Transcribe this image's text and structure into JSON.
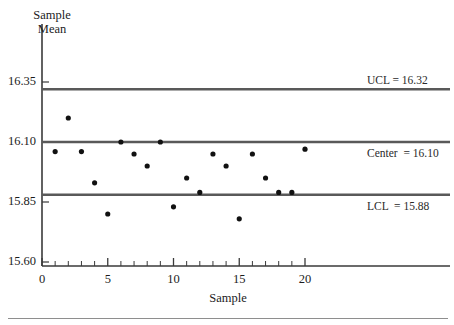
{
  "chart_data": {
    "type": "scatter",
    "title": "",
    "subtitle": "",
    "xlabel": "Sample",
    "ylabel": "Sample\nMean",
    "ylabel_line1": "Sample",
    "ylabel_line2": "Mean",
    "x": [
      1,
      2,
      3,
      4,
      5,
      6,
      7,
      8,
      9,
      10,
      11,
      12,
      13,
      14,
      15,
      16,
      17,
      18,
      19,
      20
    ],
    "values": [
      16.06,
      16.2,
      16.06,
      15.93,
      15.8,
      16.1,
      16.05,
      16.0,
      16.1,
      15.83,
      15.95,
      15.89,
      16.05,
      16.0,
      15.78,
      16.05,
      15.95,
      15.89,
      15.89,
      16.07
    ],
    "series": [
      {
        "name": "Sample Mean",
        "values": [
          16.06,
          16.2,
          16.06,
          15.93,
          15.8,
          16.1,
          16.05,
          16.0,
          16.1,
          15.83,
          15.95,
          15.89,
          16.05,
          16.0,
          15.78,
          16.05,
          15.95,
          15.89,
          15.89,
          16.07
        ]
      }
    ],
    "xlim": [
      0,
      23.5
    ],
    "ylim": [
      15.6,
      16.47
    ],
    "xticks": [
      0,
      5,
      10,
      15,
      20
    ],
    "xtick_labels": [
      "0",
      "5",
      "10",
      "15",
      "20"
    ],
    "xminor_step": 1,
    "yticks": [
      15.6,
      15.85,
      16.1,
      16.35
    ],
    "ytick_labels": [
      "15.60",
      "15.85",
      "16.10",
      "16.35"
    ],
    "grid": false,
    "legend": "none",
    "control_limits": [
      {
        "key": "ucl",
        "label": "UCL = 16.32",
        "value": 16.32
      },
      {
        "key": "center",
        "label": "Center  = 16.10",
        "value": 16.1
      },
      {
        "key": "lcl",
        "label": "LCL  = 15.88",
        "value": 15.88
      }
    ],
    "colors": {
      "limit_line": "#595959",
      "point": "#111111",
      "axis": "#3a3a3a",
      "background": "#ffffff",
      "text": "#1c1c1c",
      "bottom_rule": "#8e8e8e"
    },
    "marker": "filled-circle",
    "marker_size": 4
  },
  "axes": {
    "y_title_line1": "Sample",
    "y_title_line2": "Mean",
    "x_title": "Sample",
    "y_ticks": [
      "16.35",
      "16.10",
      "15.85",
      "15.60"
    ],
    "x_ticks": [
      "0",
      "5",
      "10",
      "15",
      "20"
    ]
  },
  "annotations": {
    "ucl": "UCL = 16.32",
    "center": "Center  = 16.10",
    "lcl": "LCL  = 15.88"
  }
}
